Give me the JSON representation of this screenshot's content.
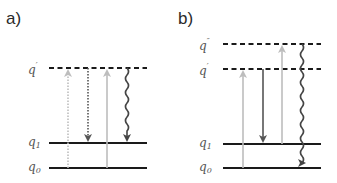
{
  "panels": [
    {
      "label": "a)",
      "levels": [
        {
          "name": "q",
          "mark": "′",
          "sub": "",
          "style": "dashed"
        },
        {
          "name": "q",
          "mark": "",
          "sub": "1",
          "style": "solid"
        },
        {
          "name": "q",
          "mark": "",
          "sub": "0",
          "style": "solid"
        }
      ],
      "transitions": [
        {
          "type": "dotted",
          "direction": "up",
          "from": "q0",
          "to": "q′",
          "color": "#bdbdbd"
        },
        {
          "type": "dotted",
          "direction": "down",
          "from": "q′",
          "to": "q1",
          "color": "#555555"
        },
        {
          "type": "solid",
          "direction": "up",
          "from": "q0",
          "to": "q′",
          "color": "#bdbdbd"
        },
        {
          "type": "wavy",
          "direction": "down",
          "from": "q′",
          "to": "q1",
          "color": "#444444"
        }
      ]
    },
    {
      "label": "b)",
      "levels": [
        {
          "name": "q",
          "mark": "″",
          "sub": "",
          "style": "dashed"
        },
        {
          "name": "q",
          "mark": "′",
          "sub": "",
          "style": "dashed"
        },
        {
          "name": "q",
          "mark": "",
          "sub": "1",
          "style": "solid"
        },
        {
          "name": "q",
          "mark": "",
          "sub": "0",
          "style": "solid"
        }
      ],
      "transitions": [
        {
          "type": "solid",
          "direction": "up",
          "from": "q0",
          "to": "q′",
          "color": "#bdbdbd"
        },
        {
          "type": "solid",
          "direction": "down",
          "from": "q′",
          "to": "q1",
          "color": "#555555"
        },
        {
          "type": "solid",
          "direction": "up",
          "from": "q1",
          "to": "q″",
          "color": "#bdbdbd"
        },
        {
          "type": "wavy",
          "direction": "down",
          "from": "q″",
          "to": "q0",
          "color": "#444444"
        }
      ]
    }
  ],
  "colors": {
    "level_line": "#1a1a1a",
    "light_arrow": "#bdbdbd",
    "dark_arrow": "#555555",
    "wavy_arrow": "#444444"
  }
}
